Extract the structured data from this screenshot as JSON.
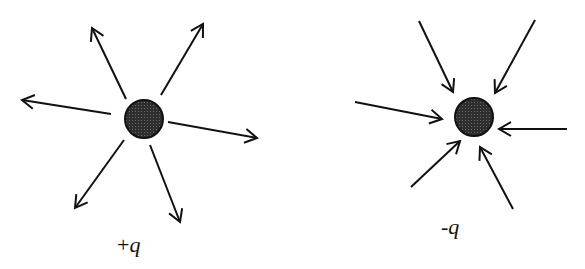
{
  "diagram": {
    "title": "",
    "colors": {
      "line": "#111111",
      "charge_fill": "#3a3a3a",
      "background": "#ffffff"
    },
    "charges": [
      {
        "id": "positive",
        "label_sign": "+",
        "label_symbol": "q",
        "center": [
          144,
          119
        ],
        "radius": 19,
        "field_direction": "outward",
        "arrows": [
          {
            "from": [
              126,
              99
            ],
            "to": [
              92,
              28
            ]
          },
          {
            "from": [
              161,
              95
            ],
            "to": [
              203,
              24
            ]
          },
          {
            "from": [
              111,
              114
            ],
            "to": [
              22,
              100
            ]
          },
          {
            "from": [
              168,
              122
            ],
            "to": [
              257,
              138
            ]
          },
          {
            "from": [
              124,
              140
            ],
            "to": [
              75,
              208
            ]
          },
          {
            "from": [
              150,
              145
            ],
            "to": [
              180,
              222
            ]
          }
        ],
        "label_pos": [
          117,
          252
        ]
      },
      {
        "id": "negative",
        "label_sign": "-",
        "label_symbol": "q",
        "center": [
          474,
          117
        ],
        "radius": 19,
        "field_direction": "inward",
        "arrows": [
          {
            "from": [
              419,
              21
            ],
            "to": [
              453,
              92
            ]
          },
          {
            "from": [
              535,
              20
            ],
            "to": [
              495,
              93
            ]
          },
          {
            "from": [
              355,
              102
            ],
            "to": [
              442,
              119
            ]
          },
          {
            "from": [
              567,
              129
            ],
            "to": [
              499,
              129
            ]
          },
          {
            "from": [
              411,
              187
            ],
            "to": [
              460,
              141
            ]
          },
          {
            "from": [
              513,
              209
            ],
            "to": [
              480,
              147
            ]
          }
        ],
        "label_pos": [
          441,
          234
        ]
      }
    ]
  }
}
